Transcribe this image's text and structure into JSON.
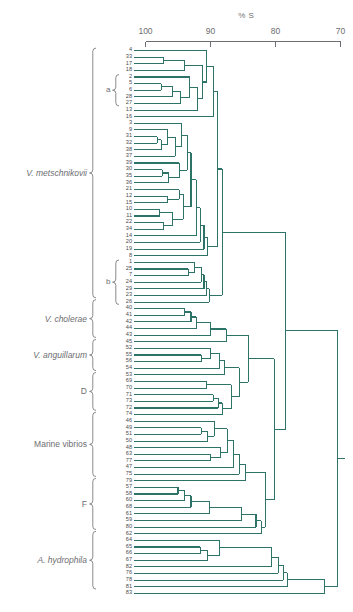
{
  "axis": {
    "title": "% S",
    "ticks": [
      {
        "label": "100",
        "value": 100
      },
      {
        "label": "90",
        "value": 90
      },
      {
        "label": "80",
        "value": 80
      },
      {
        "label": "70",
        "value": 70
      }
    ],
    "range": [
      100,
      70
    ]
  },
  "groups": [
    {
      "name": "V. metschnikovii",
      "italic": true,
      "from": 0,
      "to": 37
    },
    {
      "name": "V. cholerae",
      "italic": true,
      "from": 38,
      "to": 43
    },
    {
      "name": "V. anguillarum",
      "italic": true,
      "from": 44,
      "to": 48
    },
    {
      "name": "D",
      "italic": false,
      "from": 49,
      "to": 54
    },
    {
      "name": "Marine vibrios",
      "italic": false,
      "from": 55,
      "to": 64
    },
    {
      "name": "F",
      "italic": false,
      "from": 65,
      "to": 72
    },
    {
      "name": "A. hydrophila",
      "italic": true,
      "from": 73,
      "to": 81
    }
  ],
  "subgroups": [
    {
      "name": "a",
      "from": 4,
      "to": 8
    },
    {
      "name": "b",
      "from": 32,
      "to": 38
    }
  ],
  "chart_data": {
    "type": "dendrogram",
    "title": "% S",
    "xlabel": "% S",
    "ylabel": "",
    "xlim": [
      100,
      70
    ],
    "grid": false,
    "orientation": "horizontal-left-to-right",
    "leaf_labels": [
      "4",
      "33",
      "17",
      "18",
      "2",
      "5",
      "6",
      "28",
      "27",
      "13",
      "16",
      "3",
      "9",
      "31",
      "32",
      "38",
      "37",
      "39",
      "30",
      "35",
      "36",
      "21",
      "12",
      "15",
      "10",
      "11",
      "22",
      "34",
      "14",
      "20",
      "19",
      "8",
      "1",
      "25",
      "7",
      "24",
      "29",
      "23",
      "26",
      "40",
      "41",
      "42",
      "44",
      "43",
      "45",
      "52",
      "55",
      "56",
      "54",
      "53",
      "69",
      "70",
      "71",
      "73",
      "72",
      "74",
      "46",
      "49",
      "51",
      "50",
      "48",
      "63",
      "77",
      "47",
      "75",
      "79",
      "57",
      "58",
      "60",
      "68",
      "61",
      "59",
      "80",
      "62",
      "64",
      "65",
      "66",
      "67",
      "82",
      "76",
      "78",
      "81",
      "83"
    ],
    "merges": [
      {
        "id": "m1",
        "children": [
          "33",
          "17"
        ],
        "similarity": 97.2
      },
      {
        "id": "m2",
        "children": [
          "m1",
          "18"
        ],
        "similarity": 94.0
      },
      {
        "id": "m3",
        "children": [
          "5",
          "6"
        ],
        "similarity": 97.6
      },
      {
        "id": "m4",
        "children": [
          "m3",
          "28"
        ],
        "similarity": 95.8
      },
      {
        "id": "m5",
        "children": [
          "m4",
          "27"
        ],
        "similarity": 94.6
      },
      {
        "id": "m6",
        "children": [
          "2",
          "m5"
        ],
        "similarity": 93.2
      },
      {
        "id": "m7",
        "children": [
          "m6",
          "13"
        ],
        "similarity": 92.0
      },
      {
        "id": "m8",
        "children": [
          "m2",
          "m7"
        ],
        "similarity": 91.2
      },
      {
        "id": "m9",
        "children": [
          "4",
          "m8"
        ],
        "similarity": 90.6
      },
      {
        "id": "m10",
        "children": [
          "31",
          "32"
        ],
        "similarity": 98.2
      },
      {
        "id": "m11",
        "children": [
          "m10",
          "38"
        ],
        "similarity": 97.6
      },
      {
        "id": "m12",
        "children": [
          "9",
          "m11"
        ],
        "similarity": 96.6
      },
      {
        "id": "m13",
        "children": [
          "m12",
          "37"
        ],
        "similarity": 95.4
      },
      {
        "id": "m14",
        "children": [
          "3",
          "m13"
        ],
        "similarity": 94.4
      },
      {
        "id": "m15",
        "children": [
          "30",
          "35"
        ],
        "similarity": 97.4
      },
      {
        "id": "m16",
        "children": [
          "m15",
          "36"
        ],
        "similarity": 96.4
      },
      {
        "id": "m17",
        "children": [
          "39",
          "m16"
        ],
        "similarity": 94.8
      },
      {
        "id": "m18",
        "children": [
          "m14",
          "m17"
        ],
        "similarity": 93.6
      },
      {
        "id": "m19",
        "children": [
          "12",
          "15"
        ],
        "similarity": 96.6
      },
      {
        "id": "m20",
        "children": [
          "21",
          "m19"
        ],
        "similarity": 94.8
      },
      {
        "id": "m21",
        "children": [
          "10",
          "11"
        ],
        "similarity": 97.8
      },
      {
        "id": "m22",
        "children": [
          "22",
          "34"
        ],
        "similarity": 97.2
      },
      {
        "id": "m23",
        "children": [
          "m21",
          "m22"
        ],
        "similarity": 95.8
      },
      {
        "id": "m24",
        "children": [
          "m20",
          "m23"
        ],
        "similarity": 94.2
      },
      {
        "id": "m25",
        "children": [
          "m18",
          "m24"
        ],
        "similarity": 93.0
      },
      {
        "id": "m26",
        "children": [
          "m25",
          "14"
        ],
        "similarity": 92.2
      },
      {
        "id": "m27",
        "children": [
          "m26",
          "20"
        ],
        "similarity": 91.6
      },
      {
        "id": "m28",
        "children": [
          "m27",
          "19"
        ],
        "similarity": 91.0
      },
      {
        "id": "m29",
        "children": [
          "m28",
          "8"
        ],
        "similarity": 90.4
      },
      {
        "id": "m30",
        "children": [
          "m16b",
          "16"
        ],
        "similarity": 89.6
      },
      {
        "id": "m31",
        "children": [
          "25",
          "7"
        ],
        "similarity": 93.4
      },
      {
        "id": "m32",
        "children": [
          "1",
          "m31"
        ],
        "similarity": 92.4
      },
      {
        "id": "m33",
        "children": [
          "m32",
          "24"
        ],
        "similarity": 91.4
      },
      {
        "id": "m34",
        "children": [
          "m33",
          "29"
        ],
        "similarity": 91.0
      },
      {
        "id": "m35",
        "children": [
          "m34",
          "23"
        ],
        "similarity": 90.6
      },
      {
        "id": "m36",
        "children": [
          "m35",
          "26"
        ],
        "similarity": 90.2
      },
      {
        "id": "m37",
        "children": [
          "b-cluster",
          "a-cluster"
        ],
        "similarity": 88.4
      },
      {
        "id": "m38",
        "children": [
          "40",
          "41"
        ],
        "similarity": 94.0
      },
      {
        "id": "m39",
        "children": [
          "m38",
          "42"
        ],
        "similarity": 93.0
      },
      {
        "id": "m40",
        "children": [
          "m39",
          "44"
        ],
        "similarity": 92.2
      },
      {
        "id": "m41",
        "children": [
          "m40",
          "43"
        ],
        "similarity": 90.0
      },
      {
        "id": "m42",
        "children": [
          "m41",
          "45"
        ],
        "similarity": 87.6
      },
      {
        "id": "m43",
        "children": [
          "55",
          "56"
        ],
        "similarity": 91.4
      },
      {
        "id": "m44",
        "children": [
          "52",
          "m43"
        ],
        "similarity": 90.0
      },
      {
        "id": "m45",
        "children": [
          "m44",
          "54"
        ],
        "similarity": 88.6
      },
      {
        "id": "m46",
        "children": [
          "m45",
          "53"
        ],
        "similarity": 87.8
      },
      {
        "id": "m47",
        "children": [
          "69",
          "70"
        ],
        "similarity": 90.6
      },
      {
        "id": "m48",
        "children": [
          "71",
          "73"
        ],
        "similarity": 89.6
      },
      {
        "id": "m49",
        "children": [
          "m48",
          "72"
        ],
        "similarity": 88.8
      },
      {
        "id": "m50",
        "children": [
          "m49",
          "74"
        ],
        "similarity": 88.2
      },
      {
        "id": "m51",
        "children": [
          "m47",
          "m50"
        ],
        "similarity": 86.8
      },
      {
        "id": "m52",
        "children": [
          "vib-cholerae",
          "vib-angD"
        ],
        "similarity": 85.0
      },
      {
        "id": "m53",
        "children": [
          "49",
          "51"
        ],
        "similarity": 91.4
      },
      {
        "id": "m54",
        "children": [
          "m53",
          "50"
        ],
        "similarity": 90.4
      },
      {
        "id": "m55",
        "children": [
          "46",
          "m54"
        ],
        "similarity": 89.4
      },
      {
        "id": "m56",
        "children": [
          "63",
          "77"
        ],
        "similarity": 90.0
      },
      {
        "id": "m57",
        "children": [
          "48",
          "m56"
        ],
        "similarity": 88.4
      },
      {
        "id": "m58",
        "children": [
          "m55",
          "m57"
        ],
        "similarity": 87.4
      },
      {
        "id": "m59",
        "children": [
          "m58",
          "47"
        ],
        "similarity": 86.4
      },
      {
        "id": "m60",
        "children": [
          "m59",
          "75"
        ],
        "similarity": 85.6
      },
      {
        "id": "m61",
        "children": [
          "m60",
          "79"
        ],
        "similarity": 84.6
      },
      {
        "id": "m62",
        "children": [
          "57",
          "58"
        ],
        "similarity": 95.0
      },
      {
        "id": "m63",
        "children": [
          "m62",
          "60"
        ],
        "similarity": 94.0
      },
      {
        "id": "m64",
        "children": [
          "m63",
          "68"
        ],
        "similarity": 93.0
      },
      {
        "id": "m65",
        "children": [
          "m64",
          "61"
        ],
        "similarity": 90.2
      },
      {
        "id": "m66",
        "children": [
          "m65",
          "59"
        ],
        "similarity": 85.2
      },
      {
        "id": "m67",
        "children": [
          "marine",
          "Fgrp"
        ],
        "similarity": 81.6
      },
      {
        "id": "m68",
        "children": [
          "65",
          "66"
        ],
        "similarity": 91.6
      },
      {
        "id": "m69",
        "children": [
          "m68",
          "67"
        ],
        "similarity": 90.4
      },
      {
        "id": "m70",
        "children": [
          "64",
          "m69"
        ],
        "similarity": 88.6
      },
      {
        "id": "m71",
        "children": [
          "m70",
          "82"
        ],
        "similarity": 80.6
      },
      {
        "id": "m72",
        "children": [
          "m71",
          "76"
        ],
        "similarity": 79.6
      },
      {
        "id": "m73",
        "children": [
          "m72",
          "78"
        ],
        "similarity": 78.8
      },
      {
        "id": "m74",
        "children": [
          "m73",
          "81"
        ],
        "similarity": 78.2
      },
      {
        "id": "m75",
        "children": [
          "m74",
          "83"
        ],
        "similarity": 72.4
      },
      {
        "id": "root",
        "children": [
          "vibrios",
          "aeromonads"
        ],
        "similarity": 70.4
      }
    ]
  },
  "colors": {
    "tree": "#2d7367",
    "axis": "#6d6e71",
    "label": "#58585a",
    "background": "#ffffff"
  }
}
